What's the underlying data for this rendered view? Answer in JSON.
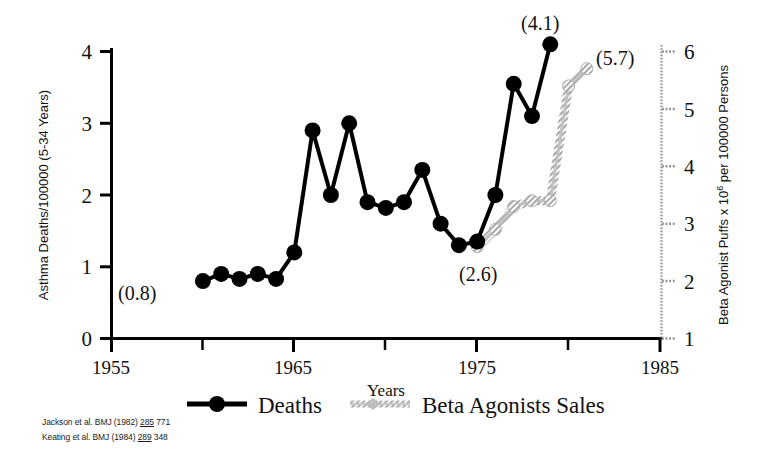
{
  "chart_data": {
    "type": "line",
    "title": "",
    "xlabel": "Years",
    "ylabel": "Asthma Deaths/100000 (5-34 Years)",
    "ylabel_right": "Beta Agonist Puffs  x 10⁶ per 100000 Persons",
    "xlim": [
      1955,
      1985
    ],
    "ylim": [
      0,
      4
    ],
    "ylim_right": [
      1,
      6
    ],
    "xticks": [
      1955,
      1965,
      1975,
      1985
    ],
    "xticks_minor": [
      1960,
      1970,
      1980
    ],
    "yticks": [
      0,
      1,
      2,
      3,
      4
    ],
    "yticks_right": [
      1,
      2,
      3,
      4,
      5,
      6
    ],
    "grid": false,
    "legend_position": "bottom",
    "series": [
      {
        "name": "Deaths",
        "axis": "left",
        "color": "#000000",
        "marker": "filled-circle",
        "x": [
          1960,
          1961,
          1962,
          1963,
          1964,
          1965,
          1966,
          1967,
          1968,
          1969,
          1970,
          1971,
          1972,
          1973,
          1974,
          1975,
          1976,
          1977,
          1978,
          1979
        ],
        "values": [
          0.8,
          0.9,
          0.83,
          0.9,
          0.83,
          1.2,
          2.9,
          2.0,
          3.0,
          1.9,
          1.82,
          1.9,
          2.35,
          1.6,
          1.3,
          1.35,
          2.0,
          3.55,
          3.1,
          4.1
        ]
      },
      {
        "name": "Beta Agonists Sales",
        "axis": "right",
        "color": "#b9b9b9",
        "marker": "hatched",
        "x": [
          1975,
          1976,
          1977,
          1978,
          1979,
          1980,
          1981
        ],
        "values": [
          2.6,
          2.9,
          3.3,
          3.4,
          3.4,
          5.4,
          5.7
        ]
      }
    ],
    "annotations": [
      {
        "text": "(0.8)",
        "x": 1960,
        "y": 0.8,
        "position": "below-right"
      },
      {
        "text": "(2.6)",
        "x": 1975,
        "y": 1.35,
        "position": "below"
      },
      {
        "text": "(4.1)",
        "x": 1979,
        "y": 4.1,
        "position": "above"
      },
      {
        "text": "(5.7)",
        "x": 1981,
        "y": 5.7,
        "position": "above-right"
      }
    ]
  },
  "axes": {
    "left_title": "Asthma Deaths/100000 (5-34 Years)",
    "right_title": "Beta Agonist Puffs  x 10",
    "right_title_exp": "6",
    "right_title_tail": " per 100000 Persons",
    "x_title": "Years",
    "x_tick_1": "1955",
    "x_tick_2": "1965",
    "x_tick_3": "1975",
    "x_tick_4": "1985",
    "y_tick_0": "0",
    "y_tick_1": "1",
    "y_tick_2": "2",
    "y_tick_3": "3",
    "y_tick_4": "4",
    "yr_tick_1": "1",
    "yr_tick_2": "2",
    "yr_tick_3": "3",
    "yr_tick_4": "4",
    "yr_tick_5": "5",
    "yr_tick_6": "6"
  },
  "annotations": {
    "a1": "(0.8)",
    "a2": "(2.6)",
    "a3": "(4.1)",
    "a4": "(5.7)"
  },
  "legend": {
    "deaths_label": "Deaths",
    "sales_label": "Beta Agonists Sales"
  },
  "citations": [
    {
      "author": "Jackson et al. BMJ (1982) ",
      "volume": "285",
      "pages": " 771"
    },
    {
      "author": "Keating et al. BMJ (1984) ",
      "volume": "289",
      "pages": " 348"
    }
  ]
}
